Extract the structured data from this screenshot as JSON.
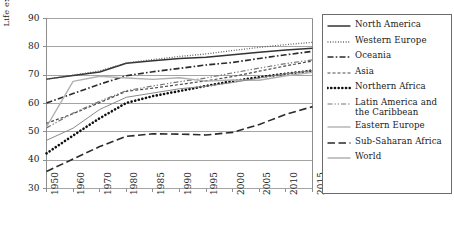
{
  "chart_data": {
    "type": "line",
    "title": "",
    "xlabel": "",
    "ylabel": "Life expectancy at birth (years)",
    "ylim": [
      30,
      90
    ],
    "ytick_labels": [
      "90",
      "80",
      "70",
      "60",
      "50",
      "40",
      "30"
    ],
    "yticks": [
      90,
      80,
      70,
      60,
      50,
      40,
      30
    ],
    "grid": "horizontal",
    "legend_position": "right-outside",
    "x": [
      1950,
      1960,
      1970,
      1980,
      1985,
      1990,
      1995,
      2000,
      2005,
      2010,
      2015
    ],
    "xtick_labels": [
      "1950",
      "1960",
      "1970",
      "1980",
      "1985",
      "1990",
      "1995",
      "2000",
      "2005",
      "2010",
      "2015"
    ],
    "series": [
      {
        "name": "North America",
        "style": "solid",
        "color": "#333333",
        "width": 1.5,
        "values": [
          68.6,
          69.9,
          71.1,
          74.2,
          75.1,
          75.9,
          76.3,
          77.2,
          78.1,
          78.9,
          79.5
        ]
      },
      {
        "name": "Western Europe",
        "style": "dotted",
        "color": "#555555",
        "width": 1.3,
        "values": [
          68.5,
          70.0,
          71.5,
          74.3,
          75.5,
          76.6,
          77.5,
          78.7,
          79.8,
          80.8,
          81.6
        ]
      },
      {
        "name": "Oceania",
        "style": "dashdot",
        "color": "#2b2b2b",
        "width": 1.6,
        "values": [
          60.2,
          63.5,
          66.8,
          69.8,
          71.2,
          72.4,
          73.6,
          74.5,
          75.9,
          77.2,
          78.4
        ]
      },
      {
        "name": "Asia",
        "style": "dashed-short",
        "color": "#4a4a4a",
        "width": 1.2,
        "values": [
          53.0,
          56.4,
          60.3,
          64.3,
          65.4,
          66.7,
          68.0,
          69.5,
          71.4,
          73.3,
          75.0
        ]
      },
      {
        "name": "Northern Africa",
        "style": "thick-dots",
        "color": "#111111",
        "width": 2.6,
        "values": [
          42.4,
          48.7,
          54.8,
          60.2,
          62.6,
          64.4,
          66.2,
          67.9,
          69.3,
          70.5,
          71.6
        ]
      },
      {
        "name": "Latin America and\nthe Caribbean",
        "style": "dash-dot-dot",
        "color": "#777777",
        "width": 1.2,
        "values": [
          51.4,
          56.6,
          60.8,
          64.5,
          66.2,
          67.7,
          69.0,
          70.8,
          72.5,
          74.1,
          75.4
        ]
      },
      {
        "name": "Eastern Europe",
        "style": "solid-light",
        "color": "#b0b0b0",
        "width": 1.4,
        "values": [
          51.7,
          67.8,
          69.6,
          69.0,
          68.5,
          69.1,
          67.9,
          68.3,
          68.2,
          69.8,
          71.0
        ]
      },
      {
        "name": "Sub-Saharan Africa",
        "style": "long-dash",
        "color": "#2b2b2b",
        "width": 1.6,
        "values": [
          36.0,
          40.4,
          44.8,
          48.4,
          49.3,
          49.2,
          48.9,
          49.8,
          52.6,
          56.2,
          58.9
        ]
      },
      {
        "name": "World",
        "style": "thin-solid",
        "color": "#8a8a8a",
        "width": 1.0,
        "values": [
          47.0,
          51.3,
          57.9,
          62.2,
          63.7,
          65.2,
          66.1,
          67.4,
          69.0,
          70.5,
          71.6
        ]
      }
    ]
  }
}
